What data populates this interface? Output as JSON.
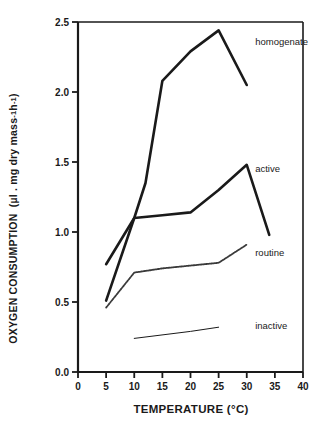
{
  "chart_data": {
    "type": "line",
    "title": "",
    "xlabel": "TEMPERATURE (°C)",
    "ylabel": "OXYGEN CONSUMPTION  (µl . mg dry mass ⁻¹ h⁻¹)",
    "ylabel_parts": {
      "main": "OXYGEN CONSUMPTION",
      "units_prefix": "(µl . mg dry mass ",
      "exp1": "-1",
      "mid": " h",
      "exp2": "-1",
      "units_suffix": ")"
    },
    "xlim": [
      0,
      40
    ],
    "ylim": [
      0.0,
      2.5
    ],
    "xticks": [
      0,
      5,
      10,
      15,
      20,
      25,
      30,
      35,
      40
    ],
    "xtick_labels": [
      "0",
      "5",
      "10",
      "15",
      "20",
      "25",
      "30",
      "35",
      "40"
    ],
    "yticks": [
      0.0,
      0.5,
      1.0,
      1.5,
      2.0,
      2.5
    ],
    "ytick_labels": [
      "0.0",
      "0.5",
      "1.0",
      "1.5",
      "2.0",
      "2.5"
    ],
    "grid": false,
    "legend_position": "inline-right",
    "series": [
      {
        "name": "homogenate",
        "label": "homogenate",
        "color": "#1a1a1a",
        "width": 2.6,
        "style": "solid",
        "label_x": 31.5,
        "label_y": 2.36,
        "x": [
          5,
          10,
          12,
          15,
          20,
          25,
          30
        ],
        "y": [
          0.77,
          1.1,
          1.35,
          2.08,
          2.29,
          2.44,
          2.05
        ]
      },
      {
        "name": "active",
        "label": "active",
        "color": "#1a1a1a",
        "width": 2.6,
        "style": "solid",
        "label_x": 31.5,
        "label_y": 1.45,
        "x": [
          5,
          10,
          15,
          20,
          25,
          30,
          34
        ],
        "y": [
          0.51,
          1.1,
          1.12,
          1.14,
          1.3,
          1.48,
          0.98
        ]
      },
      {
        "name": "routine",
        "label": "routine",
        "color": "#3a3a3a",
        "width": 1.8,
        "style": "dotted-thick",
        "label_x": 31.5,
        "label_y": 0.85,
        "x": [
          5,
          10,
          15,
          20,
          25,
          30
        ],
        "y": [
          0.46,
          0.71,
          0.74,
          0.76,
          0.78,
          0.91
        ]
      },
      {
        "name": "inactive",
        "label": "inactive",
        "color": "#1a1a1a",
        "width": 1.0,
        "style": "solid",
        "label_x": 31.5,
        "label_y": 0.33,
        "x": [
          10,
          20,
          25
        ],
        "y": [
          0.24,
          0.29,
          0.32
        ]
      }
    ],
    "axes_pixels": {
      "left": 78,
      "right": 303,
      "top": 22,
      "bottom": 372
    }
  }
}
